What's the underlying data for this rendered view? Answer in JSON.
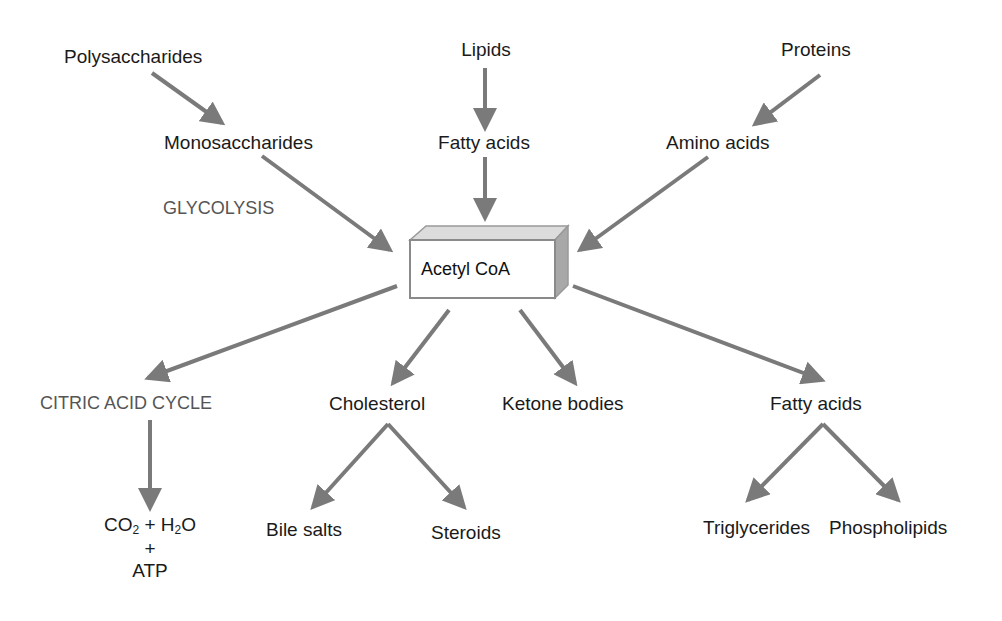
{
  "diagram": {
    "center_node": "Acetyl CoA",
    "inputs": [
      {
        "source": "Polysaccharides",
        "intermediate": "Monosaccharides",
        "process": "GLYCOLYSIS"
      },
      {
        "source": "Lipids",
        "intermediate": "Fatty acids"
      },
      {
        "source": "Proteins",
        "intermediate": "Amino acids"
      }
    ],
    "outputs": [
      {
        "label": "CITRIC ACID CYCLE",
        "products": {
          "line1_co2": "CO",
          "co2_sub": "2",
          "plus1": "+ H",
          "h2o_sub": "2",
          "o": "O",
          "plus2": "+",
          "atp": "ATP"
        }
      },
      {
        "label": "Cholesterol",
        "children": [
          "Bile salts",
          "Steroids"
        ]
      },
      {
        "label": "Ketone bodies"
      },
      {
        "label": "Fatty acids",
        "children": [
          "Triglycerides",
          "Phospholipids"
        ]
      }
    ],
    "arrow_color": "#7a7a7a"
  }
}
